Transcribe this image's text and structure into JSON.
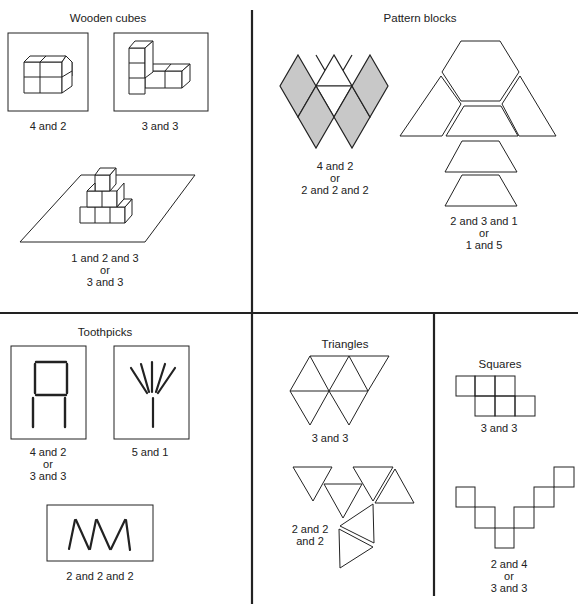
{
  "panels": {
    "wooden_cubes": {
      "title": "Wooden cubes",
      "items": [
        {
          "label": [
            "4 and 2"
          ]
        },
        {
          "label": [
            "3 and 3"
          ]
        },
        {
          "label": [
            "1 and 2 and 3",
            "or",
            "3 and 3"
          ]
        }
      ]
    },
    "pattern_blocks": {
      "title": "Pattern blocks",
      "items": [
        {
          "label": [
            "4 and 2",
            "or",
            "2 and 2 and 2"
          ]
        },
        {
          "label": [
            "2 and 3 and 1",
            "or",
            "1 and 5"
          ]
        }
      ]
    },
    "toothpicks": {
      "title": "Toothpicks",
      "items": [
        {
          "label": [
            "4 and 2",
            "or",
            "3 and 3"
          ]
        },
        {
          "label": [
            "5 and 1"
          ]
        },
        {
          "label": [
            "2 and 2 and 2"
          ]
        }
      ]
    },
    "triangles": {
      "title": "Triangles",
      "items": [
        {
          "label": [
            "3 and 3"
          ]
        },
        {
          "label": [
            "2 and 2",
            "and 2"
          ]
        }
      ]
    },
    "squares": {
      "title": "Squares",
      "items": [
        {
          "label": [
            "3 and 3"
          ]
        },
        {
          "label": [
            "2 and 4",
            "or",
            "3 and 3"
          ]
        }
      ]
    }
  },
  "colors": {
    "line": "#222222",
    "rhombus_fill": "#c8c8c8"
  }
}
